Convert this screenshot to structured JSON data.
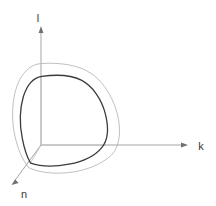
{
  "figure": {
    "title": "",
    "type": "3d-axes-contour-diagram",
    "background_color": "#ffffff",
    "width": 216,
    "height": 206
  },
  "axes": {
    "origin": {
      "x": 41,
      "y": 145
    },
    "items": [
      {
        "name": "vertical-axis",
        "label": "l",
        "label_x": 41,
        "label_y": 18,
        "from_x": 41,
        "from_y": 145,
        "to_x": 41,
        "to_y": 28,
        "color": "#9a9a9a",
        "arrow": true
      },
      {
        "name": "horizontal-axis",
        "label": "k",
        "label_x": 201,
        "label_y": 149,
        "from_x": 41,
        "from_y": 145,
        "to_x": 187,
        "to_y": 145,
        "color": "#9a9a9a",
        "arrow": true
      },
      {
        "name": "depth-axis",
        "label": "n",
        "label_x": 24,
        "label_y": 196,
        "from_x": 41,
        "from_y": 145,
        "to_x": 12,
        "to_y": 184,
        "color": "#9a9a9a",
        "arrow": true
      }
    ]
  },
  "contours": [
    {
      "name": "outer-contour",
      "description": "outer light gray rounded-triangular contour",
      "color": "#b0b0b0",
      "stroke_width": 0.8,
      "path": "M 41.5 63.5 C 30 64.5 20.5 74 16 88 C 11 103.5 11.5 122 15.5 138.5 C 18.5 151 23 161 28.5 167.5 C 37 172 52 174.5 67.5 173 C 85 171.5 101.5 165.5 110.5 156.5 C 118.5 148.5 121.5 135 119 120 C 116 102 106 84 92.5 74.5 C 78.5 64.5 60 62.5 41.5 63.5 Z"
    },
    {
      "name": "inner-contour",
      "description": "inner dark rounded-triangular contour (octant surface)",
      "color": "#3c3c3c",
      "stroke_width": 1.3,
      "path": "M 42 76.5 C 33 78 26.5 86 23 97.5 C 19.5 109.5 19.5 125 22 138 C 24 149 27 157.5 30.5 163 C 40 166.5 54 167 68 164.5 C 82.5 162 95 156 101.5 148 C 107.5 140.5 108.5 128.5 105.5 115 C 102 99.5 93 86.5 81.5 80.5 C 70 74.5 56 74.5 42 76.5 Z"
    }
  ],
  "interior_lines": [
    {
      "name": "interior-vertical-segment",
      "from_x": 41,
      "from_y": 76,
      "to_x": 41,
      "to_y": 145,
      "color": "#b5b5b5"
    },
    {
      "name": "interior-depth-segment",
      "from_x": 41,
      "from_y": 145,
      "to_x": 30,
      "to_y": 163,
      "color": "#b5b5b5"
    },
    {
      "name": "interior-horizontal-segment",
      "from_x": 41,
      "from_y": 145,
      "to_x": 106,
      "to_y": 145,
      "color": "#b5b5b5"
    }
  ],
  "colors": {
    "background": "#ffffff",
    "axis": "#9a9a9a",
    "outer_contour": "#b0b0b0",
    "inner_contour": "#3c3c3c",
    "label_text": "#3a3a3a"
  },
  "chart_data": {
    "type": "line",
    "title": "",
    "xlabel": "k",
    "ylabel": "l",
    "zlabel": "n",
    "grid": false,
    "legend": null,
    "axis_labels": [
      "l",
      "k",
      "n"
    ],
    "series": [
      {
        "name": "outer-contour",
        "color": "#b0b0b0",
        "closed": true,
        "points": [
          [
            41.5,
            63.5
          ],
          [
            30,
            64.5
          ],
          [
            20.5,
            74
          ],
          [
            16,
            88
          ],
          [
            11.5,
            105
          ],
          [
            11.5,
            122
          ],
          [
            15.5,
            138.5
          ],
          [
            23,
            161
          ],
          [
            28.5,
            167.5
          ],
          [
            45,
            172.5
          ],
          [
            67.5,
            173
          ],
          [
            90,
            169
          ],
          [
            110.5,
            156.5
          ],
          [
            119.5,
            143
          ],
          [
            119,
            120
          ],
          [
            112,
            99
          ],
          [
            92.5,
            74.5
          ],
          [
            70,
            64.5
          ],
          [
            41.5,
            63.5
          ]
        ]
      },
      {
        "name": "inner-contour",
        "color": "#3c3c3c",
        "closed": true,
        "points": [
          [
            42,
            76.5
          ],
          [
            33,
            78
          ],
          [
            26.5,
            86
          ],
          [
            23,
            97.5
          ],
          [
            20,
            112
          ],
          [
            22,
            138
          ],
          [
            26,
            155
          ],
          [
            30.5,
            163
          ],
          [
            45,
            165.8
          ],
          [
            68,
            164.5
          ],
          [
            88,
            159
          ],
          [
            101.5,
            148
          ],
          [
            107.5,
            136
          ],
          [
            105.5,
            115
          ],
          [
            99,
            99
          ],
          [
            81.5,
            80.5
          ],
          [
            62,
            75
          ],
          [
            42,
            76.5
          ]
        ]
      }
    ]
  }
}
